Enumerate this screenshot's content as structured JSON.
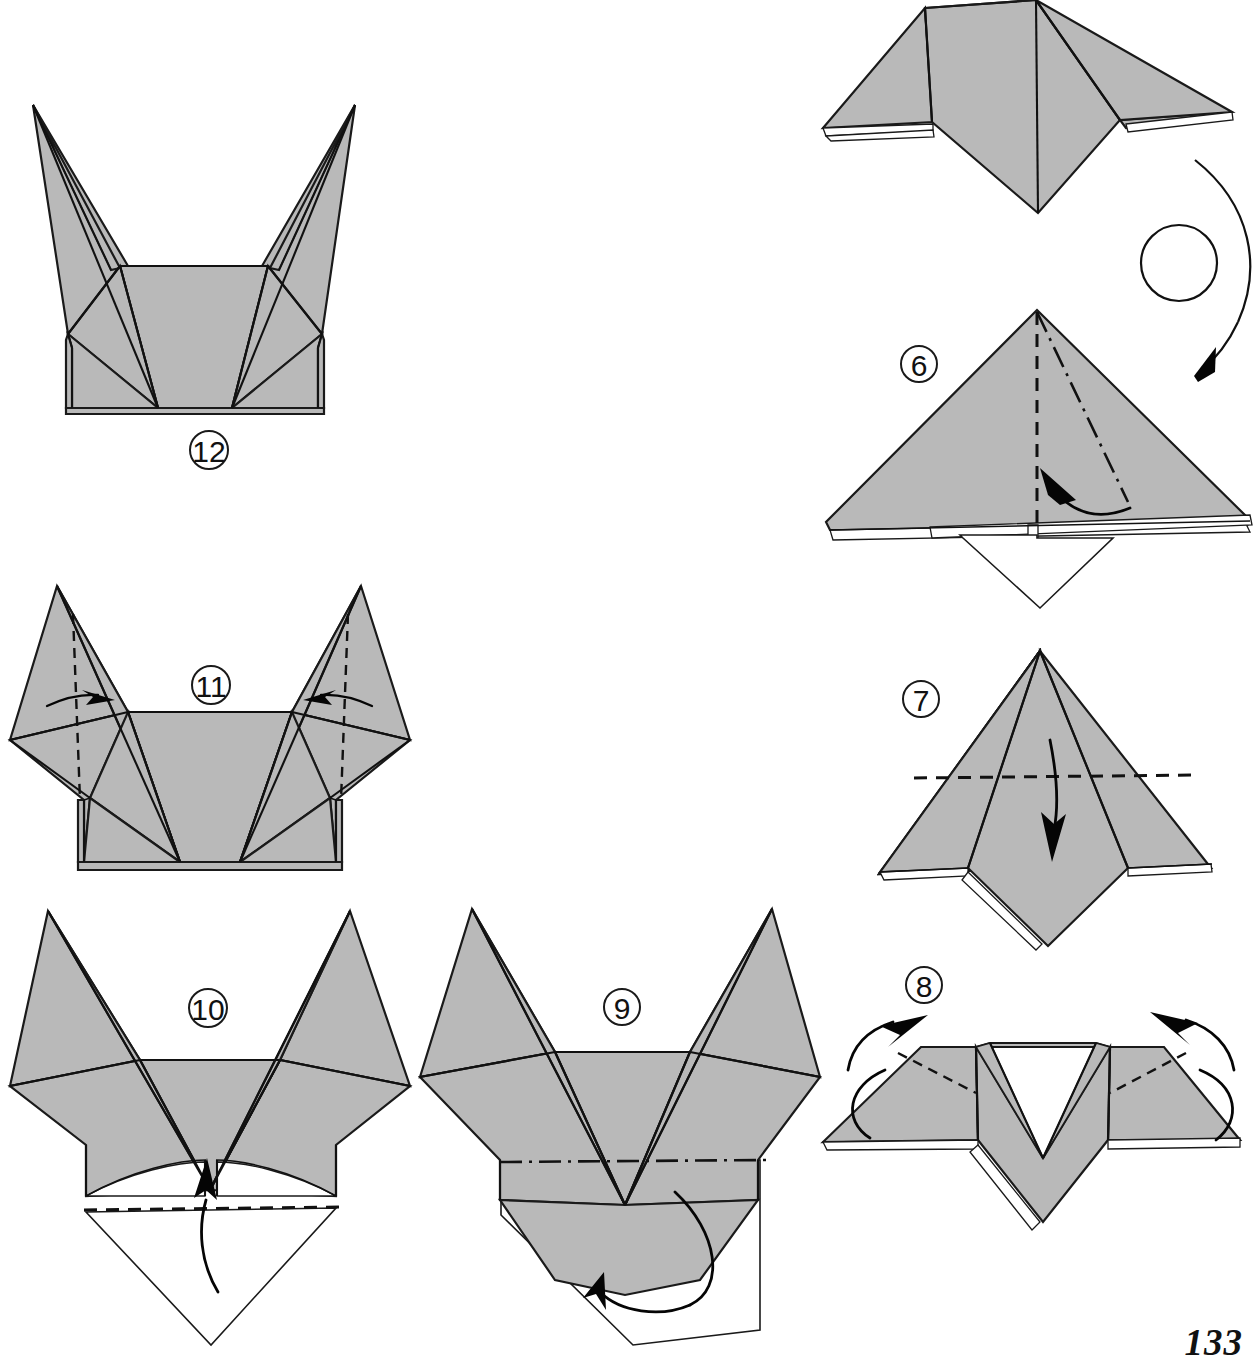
{
  "page": {
    "number": "133",
    "kind": "origami-instruction-page",
    "width": 1257,
    "height": 1369,
    "background_color": "#ffffff",
    "paper_fill_color": "#b9b9b9",
    "ink_color": "#111111",
    "paper_back_color": "#ffffff"
  },
  "steps": [
    {
      "id": "step-5-result",
      "badge": "",
      "caption": "",
      "description": "Completed shape from previous step: wide kite with two side flaps and a lower diamond point, shown before turning over.",
      "badge_position": null
    },
    {
      "id": "step-6",
      "badge": "6",
      "badge_x": 919,
      "badge_y": 364,
      "description": "Large shaded triangle with vertical valley-fold line and a mountain-fold line at the right; arrow points up-left toward the center to swing a hidden flap; white diamond point protrudes below.",
      "fold_lines": [
        "valley-vertical-center",
        "mountain-diagonal-right"
      ],
      "arrows": [
        "curved-arrow-up-left"
      ]
    },
    {
      "id": "step-7",
      "badge": "7",
      "badge_x": 921,
      "badge_y": 699,
      "description": "Triangle with a horizontal dashed valley-fold line across the upper third and a straight downward arrow folding the top point down.",
      "fold_lines": [
        "valley-horizontal"
      ],
      "arrows": [
        "straight-arrow-down"
      ]
    },
    {
      "id": "step-8",
      "badge": "8",
      "badge_x": 924,
      "badge_y": 985,
      "description": "Flattened wide shape with two short dotted fold lines near the shoulders; two curved arrows at left and right sweep the outer wings upward and around.",
      "fold_lines": [
        "dotted-left-shoulder",
        "dotted-right-shoulder"
      ],
      "arrows": [
        "curved-arrow-left-up",
        "curved-arrow-right-up"
      ]
    },
    {
      "id": "step-9",
      "badge": "9",
      "badge_x": 622,
      "badge_y": 1007,
      "description": "Fox-head shape with two tall ears; a horizontal dash-dot mountain-fold line crosses the lower muzzle and a curved arrow loops around the bottom point to fold it behind.",
      "fold_lines": [
        "mountain-horizontal-lower"
      ],
      "arrows": [
        "curved-wrap-around-arrow"
      ]
    },
    {
      "id": "step-10",
      "badge": "10",
      "badge_x": 208,
      "badge_y": 1008,
      "description": "Same head shape with a horizontal dashed valley line at the bottom edge and a curved arrow sweeping the white lower point upward behind the model.",
      "fold_lines": [
        "valley-horizontal-bottom"
      ],
      "arrows": [
        "curved-arrow-up"
      ]
    },
    {
      "id": "step-11",
      "badge": "11",
      "badge_x": 211,
      "badge_y": 685,
      "description": "Head shape with both ears upright; each ear carries a vertical dashed valley line and a short horizontal arrow pointing inward to narrow the ears.",
      "fold_lines": [
        "valley-vertical-left-ear",
        "valley-vertical-right-ear"
      ],
      "arrows": [
        "arrow-right-into-left-ear",
        "arrow-left-into-right-ear"
      ]
    },
    {
      "id": "step-12",
      "badge": "12",
      "badge_x": 209,
      "badge_y": 450,
      "description": "Finished head with narrow pointed ears standing vertically above a broad muzzle; no fold lines or arrows remain.",
      "fold_lines": [],
      "arrows": []
    }
  ],
  "turn_over_symbol": {
    "id": "turn-over-arrow",
    "description": "Looping arrow with a small circle, indicating turn the model over",
    "x": 1190,
    "y": 160
  }
}
